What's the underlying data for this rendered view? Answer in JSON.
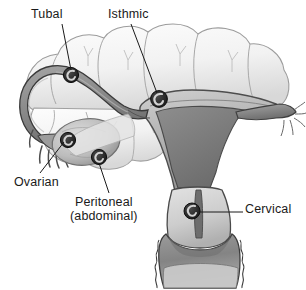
{
  "figure": {
    "type": "medical-anatomical-diagram",
    "background_color": "#ffffff",
    "ink_color": "#1a1a1a"
  },
  "labels": [
    {
      "id": "tubal",
      "text": "Tubal",
      "x": 31,
      "y": 8
    },
    {
      "id": "isthmic",
      "text": "Isthmic",
      "x": 108,
      "y": 8
    },
    {
      "id": "ovarian",
      "text": "Ovarian",
      "x": 14,
      "y": 176
    },
    {
      "id": "peritoneal",
      "text": "Peritoneal\n(abdominal)",
      "x": 70,
      "y": 196
    },
    {
      "id": "cervical",
      "text": "Cervical",
      "x": 245,
      "y": 203
    }
  ],
  "label_lines": [
    {
      "id": "tubal-leader",
      "from": [
        62,
        24
      ],
      "to": [
        71,
        72
      ]
    },
    {
      "id": "isthmic-leader",
      "from": [
        131,
        24
      ],
      "to": [
        157,
        94
      ]
    },
    {
      "id": "ovarian-leader",
      "from": [
        38,
        173
      ],
      "to": [
        66,
        141
      ]
    },
    {
      "id": "peritoneal-leader",
      "from": [
        108,
        193
      ],
      "to": [
        99,
        155
      ]
    },
    {
      "id": "cervical-leader",
      "from": [
        242,
        212
      ],
      "to": [
        196,
        212
      ]
    }
  ],
  "implantation_sites": [
    {
      "id": "site-tubal",
      "label": "Tubal",
      "cx": 71,
      "cy": 75,
      "r": 7.5
    },
    {
      "id": "site-isthmic",
      "label": "Isthmic",
      "cx": 159,
      "cy": 99,
      "r": 8.5
    },
    {
      "id": "site-ovarian",
      "label": "Ovarian",
      "cx": 68,
      "cy": 140,
      "r": 7.5
    },
    {
      "id": "site-peritoneal",
      "label": "Peritoneal (abdominal)",
      "cx": 99,
      "cy": 157,
      "r": 7.5
    },
    {
      "id": "site-cervical",
      "label": "Cervical",
      "cx": 192,
      "cy": 211,
      "r": 8
    }
  ],
  "structures": [
    {
      "id": "bowel-loops",
      "name": "intestinal loops",
      "fill": "#f3f3f3",
      "stroke": "#9a9a9a"
    },
    {
      "id": "uterus-body",
      "name": "uterus",
      "fill": "#b9b9b9",
      "stroke": "#4a4a4a"
    },
    {
      "id": "endometrial-cavity",
      "name": "endometrial cavity",
      "fill": "#7e7e7e",
      "stroke": "#4a4a4a"
    },
    {
      "id": "fallopian-tube",
      "name": "fallopian tube",
      "fill": "#8c8c8c",
      "stroke": "#3c3c3c"
    },
    {
      "id": "fimbriae",
      "name": "fimbriae",
      "fill": "#9a9a9a",
      "stroke": "#3c3c3c"
    },
    {
      "id": "ovary",
      "name": "ovary",
      "fill": "#c2c2c2",
      "stroke": "#6a6a6a"
    },
    {
      "id": "cervix",
      "name": "cervix",
      "fill": "#d5d5d5",
      "stroke": "#4a4a4a"
    },
    {
      "id": "vaginal-wall",
      "name": "vagina",
      "fill": "#8a8a8a",
      "stroke": "#3c3c3c"
    },
    {
      "id": "broad-ligament",
      "name": "broad ligament",
      "fill": "#cfcfcf",
      "stroke": "#6a6a6a"
    }
  ],
  "colors": {
    "paper": "#ffffff",
    "text": "#1a1a1a",
    "leader_line": "#1a1a1a",
    "light_tissue": "#f3f3f3",
    "mid_tissue": "#b9b9b9",
    "dark_tissue": "#7e7e7e",
    "tube_dark": "#8c8c8c",
    "embryo_dark": "#2b2b2b",
    "outline": "#4a4a4a"
  }
}
